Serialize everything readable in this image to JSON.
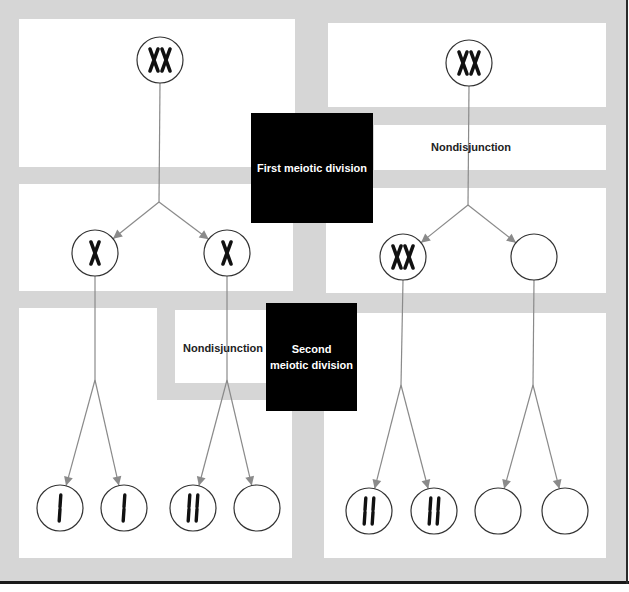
{
  "labels": {
    "first_division": "First meiotic division",
    "second_division_line1": "Second",
    "second_division_line2": "meiotic division",
    "nondisjunction_first": "Nondisjunction",
    "nondisjunction_second": "Nondisjunction"
  },
  "colors": {
    "background_gray": "#d6d6d6",
    "panel_white": "#ffffff",
    "label_box": "#000000",
    "arrow_line": "#8a8a8a",
    "circle_stroke": "#333333",
    "chromosome": "#111111"
  },
  "columns": [
    {
      "name": "normal-first-division",
      "nondisjunction_at": "second meiotic division",
      "parent": {
        "cx": 160,
        "cy": 60,
        "chromosomes": "XX"
      },
      "branch_point_1": {
        "x": 159,
        "y": 202
      },
      "daughters": [
        {
          "cx": 95,
          "cy": 253,
          "chromosomes": "X"
        },
        {
          "cx": 227,
          "cy": 253,
          "chromosomes": "X"
        }
      ],
      "branch_points_2": [
        {
          "x": 95,
          "y": 380
        },
        {
          "x": 227,
          "y": 380
        }
      ],
      "gametes": [
        {
          "cx": 60,
          "cy": 508,
          "chromosomes": "I"
        },
        {
          "cx": 124,
          "cy": 508,
          "chromosomes": "I"
        },
        {
          "cx": 193,
          "cy": 508,
          "chromosomes": "II"
        },
        {
          "cx": 257,
          "cy": 508,
          "chromosomes": ""
        }
      ]
    },
    {
      "name": "nondisjunction-first-division",
      "nondisjunction_at": "first meiotic division",
      "parent": {
        "cx": 469,
        "cy": 63,
        "chromosomes": "XX"
      },
      "branch_point_1": {
        "x": 468,
        "y": 205
      },
      "daughters": [
        {
          "cx": 403,
          "cy": 257,
          "chromosomes": "XX"
        },
        {
          "cx": 534,
          "cy": 257,
          "chromosomes": ""
        }
      ],
      "branch_points_2": [
        {
          "x": 401,
          "y": 385
        },
        {
          "x": 533,
          "y": 385
        }
      ],
      "gametes": [
        {
          "cx": 369,
          "cy": 511,
          "chromosomes": "II"
        },
        {
          "cx": 434,
          "cy": 511,
          "chromosomes": "II"
        },
        {
          "cx": 498,
          "cy": 511,
          "chromosomes": ""
        },
        {
          "cx": 565,
          "cy": 511,
          "chromosomes": ""
        }
      ]
    }
  ]
}
